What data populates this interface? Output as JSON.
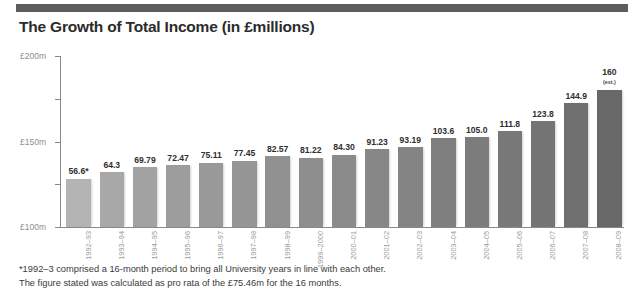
{
  "chart_data": {
    "type": "bar",
    "title": "The Growth of Total Income (in £millions)",
    "xlabel": "",
    "ylabel": "",
    "ylim": [
      0,
      200
    ],
    "grid": false,
    "legend": "none",
    "ytick_labels": [
      "£200m",
      "£150m",
      "£100m",
      "£50m",
      "0"
    ],
    "ytick_values": [
      200,
      150,
      100,
      50,
      0
    ],
    "categories": [
      "1992–93",
      "1993–94",
      "1994–95",
      "1995–96",
      "1996–97",
      "1997–98",
      "1998–99",
      "1999–2000",
      "2000–01",
      "2001–02",
      "2002–03",
      "2003–04",
      "2004–05",
      "2005–06",
      "2006–07",
      "2007–08",
      "2008–09"
    ],
    "values": [
      56.6,
      64.3,
      69.79,
      72.47,
      75.11,
      77.45,
      82.57,
      81.22,
      84.3,
      91.23,
      93.19,
      103.6,
      105.0,
      111.8,
      123.8,
      144.9,
      160
    ],
    "value_labels": [
      "56.6*",
      "64.3",
      "69.79",
      "72.47",
      "75.11",
      "77.45",
      "82.57",
      "81.22",
      "84.30",
      "91.23",
      "93.19",
      "103.6",
      "105.0",
      "111.8",
      "123.8",
      "144.9",
      "160"
    ],
    "point_notes": [
      "",
      "",
      "",
      "",
      "",
      "",
      "",
      "",
      "",
      "",
      "",
      "",
      "",
      "",
      "",
      "",
      "(est.)"
    ],
    "bar_colors": [
      "#b4b4b4",
      "#a8a8a8",
      "#a2a2a2",
      "#9d9d9d",
      "#999999",
      "#959595",
      "#909090",
      "#8e8e8e",
      "#8b8b8b",
      "#878787",
      "#848484",
      "#7f7f7f",
      "#7c7c7c",
      "#787878",
      "#747474",
      "#6f6f6f",
      "#686868"
    ],
    "annotations": [
      "*1992–3 comprised a 16-month period to bring all University years in line with each other.",
      "The figure stated was calculated as pro rata of the £75.46m for the 16 months."
    ]
  },
  "theme": {
    "rule_color": "#5d5d5d",
    "axis_color": "#8a8a8a",
    "tick_label_color": "#8e8e8e",
    "title_color": "#2b2b2b",
    "footnote_color": "#3a3a3a"
  }
}
